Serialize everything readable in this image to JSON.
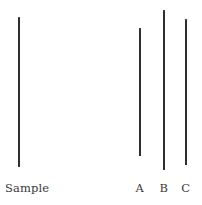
{
  "figure": {
    "background_color": "#ffffff",
    "line_color": "#2e2e30",
    "label_color": "#3a3a3c",
    "width_px": 202,
    "height_px": 205
  },
  "chart_data": {
    "type": "bar",
    "title": "",
    "subtitle": "",
    "xlabel": "",
    "ylabel": "",
    "orientation": "vertical-line-segments",
    "grid": false,
    "legend": "none",
    "categories": [
      "Sample",
      "A",
      "B",
      "C"
    ],
    "values": [
      150,
      128,
      160,
      146
    ],
    "value_unit": "px",
    "ylim": [
      0,
      205
    ],
    "segments": [
      {
        "label": "Sample",
        "x_px": 18,
        "top_px": 17,
        "bottom_px": 167,
        "length_px": 150
      },
      {
        "label": "A",
        "x_px": 139,
        "top_px": 28,
        "bottom_px": 156,
        "length_px": 128
      },
      {
        "label": "B",
        "x_px": 163,
        "top_px": 10,
        "bottom_px": 170,
        "length_px": 160
      },
      {
        "label": "C",
        "x_px": 185,
        "top_px": 19,
        "bottom_px": 165,
        "length_px": 146
      }
    ],
    "annotations": []
  },
  "labels": {
    "sample": "Sample",
    "option_a": "A",
    "option_b": "B",
    "option_c": "C"
  }
}
